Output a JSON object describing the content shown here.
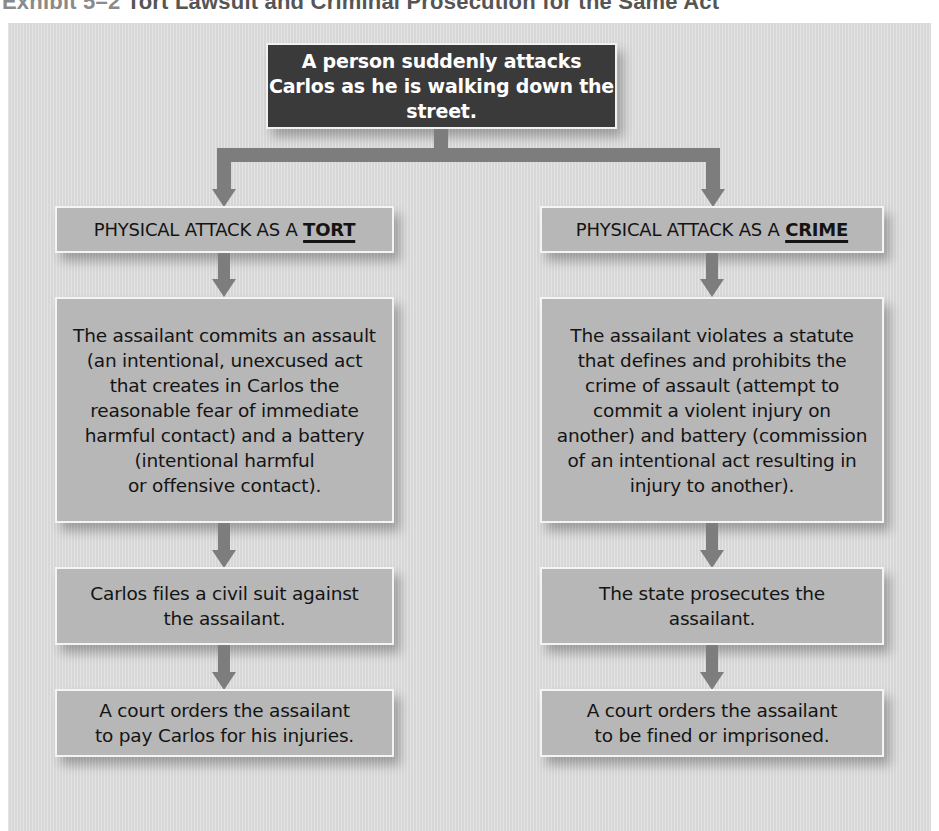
{
  "exhibit": {
    "number_label": "Exhibit 5–2",
    "title": "Tort Lawsuit and Criminal Prosecution for the Same Act"
  },
  "root": {
    "text": "A person suddenly attacks\nCarlos as he is walking down the street."
  },
  "tort_branch": {
    "header_prefix": "PHYSICAL ATTACK AS A ",
    "header_emphasis": "TORT",
    "steps": [
      {
        "text": "The assailant commits an assault\n(an intentional, unexcused act\nthat creates in Carlos the\nreasonable fear of immediate\nharmful contact) and a battery\n(intentional harmful\nor offensive contact)."
      },
      {
        "text": "Carlos files a civil suit against\nthe assailant."
      },
      {
        "text": "A court orders the assailant\nto pay Carlos for his injuries."
      }
    ]
  },
  "crime_branch": {
    "header_prefix": "PHYSICAL ATTACK AS A ",
    "header_emphasis": "CRIME",
    "steps": [
      {
        "text": "The assailant violates a statute\nthat defines and prohibits the\ncrime of assault (attempt to\ncommit a violent injury on\nanother) and battery (commission\nof an intentional act resulting in\ninjury to another)."
      },
      {
        "text": "The state prosecutes the\nassailant."
      },
      {
        "text": "A court orders the assailant\nto be fined or imprisoned."
      }
    ]
  },
  "colors": {
    "panel_bg": "#dedede",
    "box_bg": "#b7b7b7",
    "root_bg": "#3a3a3a",
    "arrow": "#7d7d7d",
    "box_border": "#f4f4f4"
  }
}
